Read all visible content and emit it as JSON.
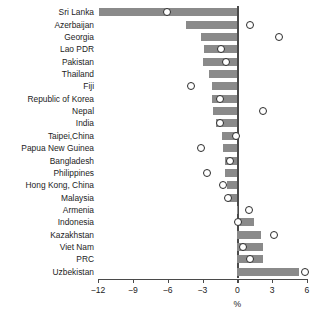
{
  "chart_data": {
    "type": "bar",
    "title": "",
    "subtitle": "",
    "xlabel": "%",
    "ylabel": "",
    "xlim": [
      -12,
      6
    ],
    "xticks": [
      -12,
      -9,
      -6,
      -3,
      0,
      3,
      6
    ],
    "xtick_labels": [
      "−12",
      "−9",
      "−6",
      "−3",
      "0",
      "3",
      "6"
    ],
    "grid": false,
    "legend_position": "none",
    "orientation": "horizontal",
    "categories": [
      "Sri Lanka",
      "Azerbaijan",
      "Georgia",
      "Lao PDR",
      "Pakistan",
      "Thailand",
      "Fiji",
      "Republic of Korea",
      "Nepal",
      "India",
      "Taipei,China",
      "Papua New Guinea",
      "Bangladesh",
      "Philippines",
      "Hong Kong, China",
      "Malaysia",
      "Armenia",
      "Indonesia",
      "Kazakhstan",
      "Viet Nam",
      "PRC",
      "Uzbekistan"
    ],
    "series": [
      {
        "name": "bar",
        "type": "bar",
        "color": "#8a8a8a",
        "values": [
          -11.9,
          -4.4,
          -3.1,
          -2.9,
          -3.0,
          -2.4,
          -2.2,
          -2.2,
          -2.1,
          -1.8,
          -1.3,
          -1.2,
          -1.1,
          -1.1,
          -0.9,
          -0.8,
          0.1,
          1.4,
          2.0,
          2.2,
          2.2,
          5.3
        ]
      },
      {
        "name": "marker",
        "type": "scatter",
        "color": "#2b2b2b",
        "values": [
          -6.1,
          1.1,
          3.6,
          -1.4,
          -1.0,
          null,
          -4.0,
          -1.5,
          2.2,
          -1.5,
          -0.1,
          -3.1,
          -0.6,
          -2.6,
          -1.2,
          -0.8,
          1.0,
          0.1,
          3.2,
          0.5,
          1.1,
          5.8
        ]
      }
    ]
  },
  "axis": {
    "x_title": "%"
  }
}
